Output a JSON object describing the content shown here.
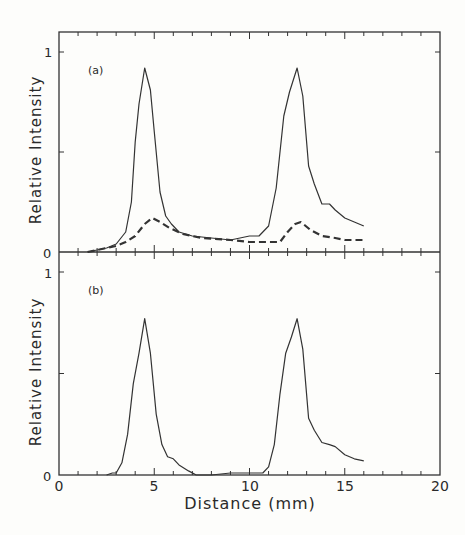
{
  "chart_data": [
    {
      "panel": "(a)",
      "type": "line",
      "ylabel": "Relative Intensity",
      "xlabel": "",
      "xlim": [
        0,
        20
      ],
      "ylim": [
        0,
        1
      ],
      "yticks": [
        "0",
        "1"
      ],
      "grid": false,
      "series": [
        {
          "name": "solid",
          "style": "solid",
          "x": [
            1.5,
            2.5,
            3.0,
            3.5,
            3.8,
            4.0,
            4.2,
            4.5,
            4.8,
            5.0,
            5.3,
            5.6,
            5.9,
            6.3,
            7.0,
            8.0,
            9.0,
            10.0,
            10.5,
            11.0,
            11.4,
            11.8,
            12.1,
            12.5,
            12.8,
            13.1,
            13.4,
            13.8,
            14.2,
            14.5,
            15.0,
            15.5,
            16.0
          ],
          "y": [
            0.0,
            0.02,
            0.04,
            0.1,
            0.25,
            0.55,
            0.74,
            0.92,
            0.81,
            0.6,
            0.3,
            0.18,
            0.14,
            0.1,
            0.08,
            0.07,
            0.06,
            0.08,
            0.08,
            0.13,
            0.32,
            0.68,
            0.8,
            0.92,
            0.78,
            0.43,
            0.34,
            0.24,
            0.24,
            0.21,
            0.17,
            0.15,
            0.13
          ]
        },
        {
          "name": "dashed",
          "style": "dashed",
          "x": [
            1.5,
            2.5,
            3.0,
            3.5,
            4.0,
            4.5,
            4.9,
            5.3,
            5.8,
            6.5,
            7.5,
            9.0,
            10.0,
            11.0,
            11.6,
            12.0,
            12.4,
            12.7,
            13.2,
            13.8,
            14.5,
            15.0,
            16.0
          ],
          "y": [
            0.0,
            0.02,
            0.03,
            0.05,
            0.08,
            0.14,
            0.17,
            0.15,
            0.12,
            0.09,
            0.07,
            0.06,
            0.05,
            0.05,
            0.05,
            0.1,
            0.14,
            0.15,
            0.11,
            0.08,
            0.07,
            0.06,
            0.06
          ]
        }
      ]
    },
    {
      "panel": "(b)",
      "type": "line",
      "ylabel": "Relative Intensity",
      "xlabel": "Distance (mm)",
      "xlim": [
        0,
        20
      ],
      "ylim": [
        0,
        1
      ],
      "xticks": [
        "0",
        "5",
        "10",
        "15",
        "20"
      ],
      "yticks": [
        "0",
        "1"
      ],
      "grid": false,
      "series": [
        {
          "name": "solid",
          "style": "solid",
          "x": [
            2.5,
            2.8,
            3.0,
            3.3,
            3.6,
            3.9,
            4.2,
            4.5,
            4.8,
            5.1,
            5.4,
            5.7,
            6.0,
            6.3,
            6.8,
            7.2,
            8.0,
            9.0,
            10.0,
            10.7,
            11.0,
            11.3,
            11.6,
            11.9,
            12.2,
            12.5,
            12.8,
            13.1,
            13.4,
            13.8,
            14.2,
            14.5,
            15.0,
            15.5,
            16.0
          ],
          "y": [
            0.0,
            0.01,
            0.01,
            0.06,
            0.2,
            0.45,
            0.6,
            0.77,
            0.6,
            0.3,
            0.15,
            0.09,
            0.08,
            0.05,
            0.02,
            0.0,
            0.0,
            0.01,
            0.01,
            0.01,
            0.04,
            0.15,
            0.4,
            0.6,
            0.68,
            0.77,
            0.62,
            0.28,
            0.22,
            0.16,
            0.15,
            0.14,
            0.1,
            0.08,
            0.07
          ]
        }
      ]
    }
  ],
  "labels": {
    "panel_a": "(a)",
    "panel_b": "(b)",
    "ylabel": "Relative Intensity",
    "xlabel": "Distance (mm)",
    "y0": "0",
    "y1": "1",
    "x0": "0",
    "x5": "5",
    "x10": "10",
    "x15": "15",
    "x20": "20"
  }
}
